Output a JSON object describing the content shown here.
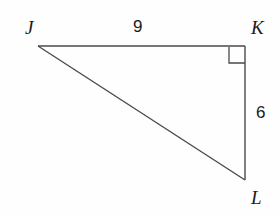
{
  "figure": {
    "kind": "right-triangle-diagram",
    "background_color": "#fefefe",
    "stroke_color": "#4a4a4a",
    "text_color": "#1a1a1a"
  },
  "vertices": [
    {
      "name": "J",
      "label": "J",
      "x": 38,
      "y": 46
    },
    {
      "name": "K",
      "label": "K",
      "x": 245,
      "y": 46
    },
    {
      "name": "L",
      "label": "L",
      "x": 245,
      "y": 180
    }
  ],
  "sides": [
    {
      "name": "JK",
      "label": "9",
      "from": "J",
      "to": "K"
    },
    {
      "name": "KL",
      "label": "6",
      "from": "K",
      "to": "L"
    },
    {
      "name": "JL",
      "label": "",
      "from": "J",
      "to": "L"
    }
  ],
  "right_angle": {
    "at_vertex": "K",
    "marker_size": 16,
    "marker_x": 229,
    "marker_y": 47
  }
}
